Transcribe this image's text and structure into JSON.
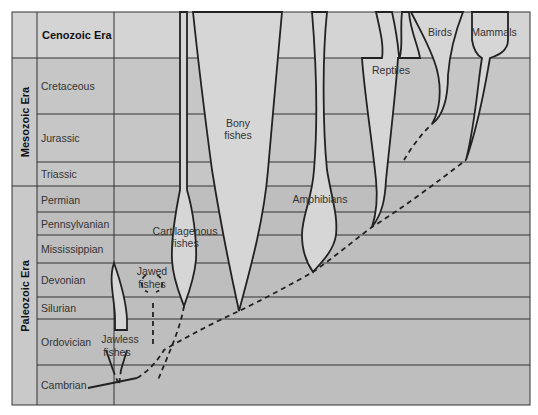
{
  "colors": {
    "cenozoic_bg": "#d4d4d4",
    "mesozoic_bg": "#c4c4c4",
    "paleozoic_bg": "#bdbdbd",
    "era_col_bg": "#c9c9c9",
    "lineage_fill": "#d6d6d6",
    "line": "#222222"
  },
  "eras": [
    {
      "name": "Cenozoic Era",
      "orientation": "horizontal"
    },
    {
      "name": "Mesozoic Era",
      "orientation": "vertical"
    },
    {
      "name": "Paleozoic Era",
      "orientation": "vertical"
    }
  ],
  "periods": [
    {
      "name": "Cretaceous",
      "era": "Mesozoic Era"
    },
    {
      "name": "Jurassic",
      "era": "Mesozoic Era"
    },
    {
      "name": "Triassic",
      "era": "Mesozoic Era"
    },
    {
      "name": "Permian",
      "era": "Paleozoic Era"
    },
    {
      "name": "Pennsylvanian",
      "era": "Paleozoic Era"
    },
    {
      "name": "Mississippian",
      "era": "Paleozoic Era"
    },
    {
      "name": "Devonian",
      "era": "Paleozoic Era"
    },
    {
      "name": "Silurian",
      "era": "Paleozoic Era"
    },
    {
      "name": "Ordovician",
      "era": "Paleozoic Era"
    },
    {
      "name": "Cambrian",
      "era": "Paleozoic Era"
    }
  ],
  "lineages": [
    {
      "name": "Jawless fishes",
      "label_lines": [
        "Jawless",
        "fishes"
      ],
      "origin_period": "Cambrian"
    },
    {
      "name": "Jawed fishes",
      "label_lines": [
        "Jawed",
        "fishes"
      ],
      "origin_period": "Ordovician",
      "status": "extinct (Devonian)"
    },
    {
      "name": "Cartilagenous fishes",
      "label_lines": [
        "Cartilagenous",
        "fishes"
      ],
      "origin_period": "Devonian"
    },
    {
      "name": "Bony fishes",
      "label_lines": [
        "Bony",
        "fishes"
      ],
      "origin_period": "Silurian"
    },
    {
      "name": "Amphibians",
      "label_lines": [
        "Amphibians"
      ],
      "origin_period": "Devonian"
    },
    {
      "name": "Reptiles",
      "label_lines": [
        "Reptiles"
      ],
      "origin_period": "Pennsylvanian"
    },
    {
      "name": "Birds",
      "label_lines": [
        "Birds"
      ],
      "origin_period": "Jurassic"
    },
    {
      "name": "Mammals",
      "label_lines": [
        "Mammals"
      ],
      "origin_period": "Triassic"
    }
  ]
}
